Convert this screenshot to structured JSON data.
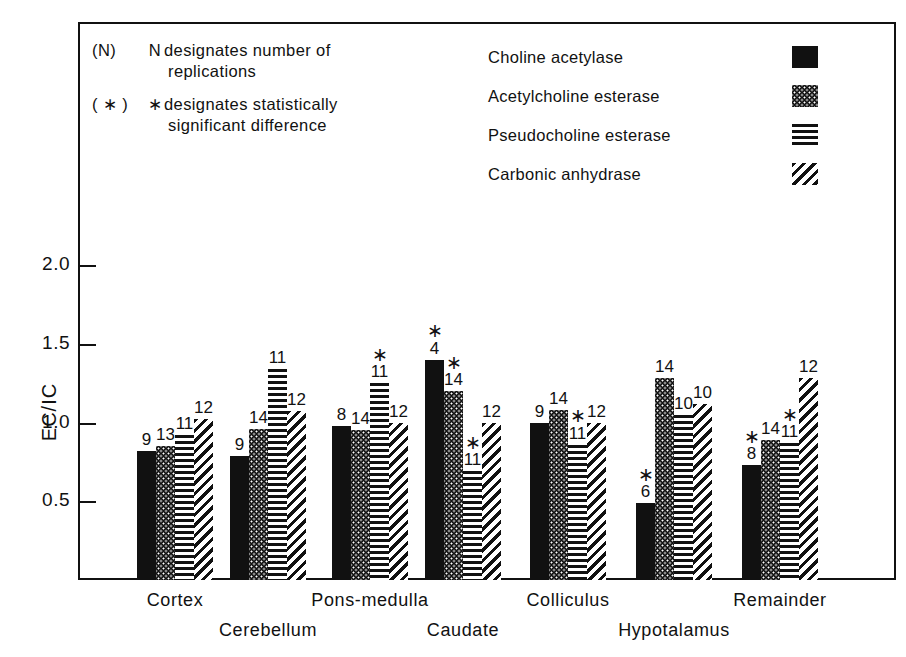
{
  "chart_data": {
    "type": "bar",
    "title": "",
    "xlabel": "",
    "ylabel": "EC/IC",
    "ylim": [
      0,
      2.25
    ],
    "yticks": [
      0.5,
      1.0,
      1.5,
      2.0
    ],
    "ytick_labels": [
      "0.5",
      "1.0",
      "1.5",
      "2.0"
    ],
    "grid": false,
    "legend_position": "top-right",
    "categories": [
      "Cortex",
      "Cerebellum",
      "Pons-medulla",
      "Caudate",
      "Colliculus",
      "Hypotalamus",
      "Remainder"
    ],
    "series": [
      {
        "name": "Choline acetylase",
        "pattern": "solid",
        "values": [
          0.82,
          0.79,
          0.98,
          1.4,
          1.0,
          0.49,
          0.73
        ],
        "n_labels": [
          "9",
          "9",
          "8",
          "4",
          "9",
          "6",
          "8"
        ],
        "significant": [
          false,
          false,
          false,
          true,
          false,
          true,
          true
        ]
      },
      {
        "name": "Acetylcholine esterase",
        "pattern": "stipple",
        "values": [
          0.85,
          0.96,
          0.95,
          1.2,
          1.08,
          1.28,
          0.89
        ],
        "n_labels": [
          "13",
          "14",
          "14",
          "14",
          "14",
          "14",
          "14"
        ],
        "significant": [
          false,
          false,
          false,
          true,
          false,
          false,
          false
        ]
      },
      {
        "name": "Pseudocholine esterase",
        "pattern": "hlines",
        "values": [
          0.92,
          1.34,
          1.25,
          0.69,
          0.86,
          1.05,
          0.87
        ],
        "n_labels": [
          "11",
          "11",
          "11",
          "11",
          "11",
          "10",
          "11"
        ],
        "significant": [
          false,
          false,
          true,
          true,
          true,
          false,
          true
        ]
      },
      {
        "name": "Carbonic anhydrase",
        "pattern": "diag",
        "values": [
          1.02,
          1.07,
          1.0,
          1.0,
          1.0,
          1.12,
          1.28
        ],
        "n_labels": [
          "12",
          "12",
          "12",
          "12",
          "12",
          "10",
          "12"
        ],
        "significant": [
          false,
          false,
          false,
          false,
          false,
          false,
          false
        ]
      }
    ]
  },
  "notes": [
    {
      "tag": "(N)",
      "symbol": "N",
      "line1": "designates  number  of",
      "line2": "replications"
    },
    {
      "tag": "( ∗ )",
      "symbol": "∗",
      "line1": "designates  statistically",
      "line2": "significant  difference"
    }
  ],
  "legend": {
    "items": [
      {
        "label": "Choline  acetylase",
        "pattern": "solid"
      },
      {
        "label": "Acetylcholine  esterase",
        "pattern": "stipple"
      },
      {
        "label": "Pseudocholine  esterase",
        "pattern": "hlines"
      },
      {
        "label": "Carbonic  anhydrase",
        "pattern": "diag"
      }
    ]
  },
  "axis": {
    "y_label": "EC/IC",
    "y_ticks": [
      "2.0",
      "1.5",
      "1.0",
      "0.5"
    ]
  },
  "star_symbol": "∗",
  "colors": {
    "ink": "#111111",
    "paper": "#ffffff"
  }
}
